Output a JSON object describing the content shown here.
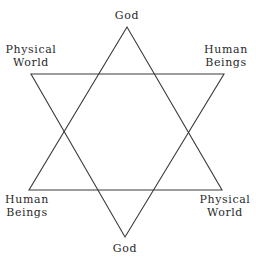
{
  "diagram": {
    "type": "hexagram",
    "stroke_color": "#3a3a3a",
    "text_color": "#2a2a2a",
    "background": "#ffffff",
    "upward_triangle": {
      "points": [
        [
          127,
          27
        ],
        [
          29,
          190
        ],
        [
          222,
          190
        ]
      ]
    },
    "downward_triangle": {
      "points": [
        [
          31,
          74
        ],
        [
          224,
          74
        ],
        [
          125,
          237
        ]
      ]
    },
    "labels": {
      "top": {
        "lines": [
          "God"
        ]
      },
      "upper_left": {
        "lines": [
          "Physical",
          "World"
        ]
      },
      "upper_right": {
        "lines": [
          "Human",
          "Beings"
        ]
      },
      "lower_left": {
        "lines": [
          "Human",
          "Beings"
        ]
      },
      "lower_right": {
        "lines": [
          "Physical",
          "World"
        ]
      },
      "bottom": {
        "lines": [
          "God"
        ]
      }
    }
  }
}
